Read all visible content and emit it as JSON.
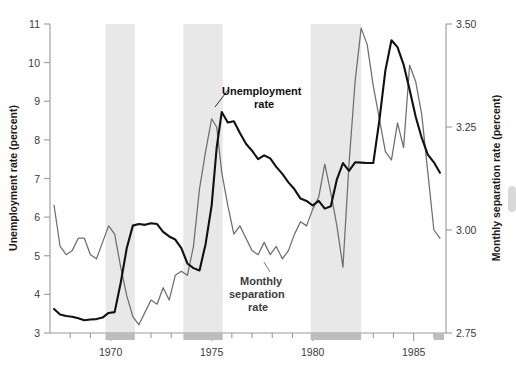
{
  "chart_data": {
    "type": "line",
    "title": "",
    "xlabel": "",
    "xlim": [
      1967.0,
      1986.6
    ],
    "x_tick_labels": [
      "1970",
      "1975",
      "1980",
      "1985"
    ],
    "x_tick_values": [
      1970,
      1975,
      1980,
      1985
    ],
    "x_minor_tick_step": 1,
    "grid": false,
    "legend": "in-plot annotations",
    "axes": [
      {
        "id": "left",
        "ylabel": "Unemployment rate (percent)",
        "ylim": [
          3,
          11
        ],
        "y_tick_labels": [
          "3",
          "4",
          "5",
          "6",
          "7",
          "8",
          "9",
          "10",
          "11"
        ],
        "y_tick_values": [
          3,
          4,
          5,
          6,
          7,
          8,
          9,
          10,
          11
        ]
      },
      {
        "id": "right",
        "ylabel": "Monthly separation rate (percent)",
        "ylim": [
          2.75,
          3.5
        ],
        "y_tick_labels": [
          "2.75",
          "3.00",
          "3.25",
          "3.50"
        ],
        "y_tick_values": [
          2.75,
          3.0,
          3.25,
          3.5
        ]
      }
    ],
    "shaded_bands": {
      "description": "recession bands",
      "color": "#e8e8e8",
      "ranges": [
        [
          1969.75,
          1971.2
        ],
        [
          1973.6,
          1975.55
        ],
        [
          1979.9,
          1982.4
        ]
      ]
    },
    "series": [
      {
        "name": "Unemployment rate",
        "axis": "left",
        "color": "#111111",
        "units": "percent",
        "x": [
          1967.2,
          1967.5,
          1967.8,
          1968.1,
          1968.4,
          1968.7,
          1969.0,
          1969.3,
          1969.6,
          1969.9,
          1970.2,
          1970.5,
          1970.8,
          1971.1,
          1971.4,
          1971.7,
          1972.0,
          1972.3,
          1972.6,
          1972.9,
          1973.2,
          1973.5,
          1973.8,
          1974.1,
          1974.4,
          1974.7,
          1975.0,
          1975.25,
          1975.5,
          1975.8,
          1976.1,
          1976.4,
          1976.7,
          1977.0,
          1977.3,
          1977.6,
          1977.9,
          1978.2,
          1978.5,
          1978.8,
          1979.1,
          1979.4,
          1979.7,
          1980.0,
          1980.3,
          1980.6,
          1980.9,
          1981.2,
          1981.5,
          1981.8,
          1982.1,
          1982.4,
          1982.7,
          1983.0,
          1983.3,
          1983.6,
          1983.9,
          1984.2,
          1984.5,
          1984.8,
          1985.1,
          1985.4,
          1985.7,
          1986.0,
          1986.3
        ],
        "y": [
          3.62,
          3.48,
          3.44,
          3.42,
          3.38,
          3.33,
          3.35,
          3.36,
          3.4,
          3.52,
          3.54,
          4.3,
          5.2,
          5.78,
          5.82,
          5.8,
          5.84,
          5.82,
          5.62,
          5.5,
          5.42,
          5.2,
          4.8,
          4.68,
          4.62,
          5.3,
          6.3,
          7.8,
          8.72,
          8.45,
          8.48,
          8.18,
          7.9,
          7.72,
          7.5,
          7.6,
          7.52,
          7.3,
          7.12,
          6.9,
          6.72,
          6.48,
          6.42,
          6.3,
          6.42,
          6.22,
          6.28,
          6.98,
          7.4,
          7.2,
          7.42,
          7.41,
          7.4,
          7.4,
          8.5,
          9.8,
          10.58,
          10.4,
          9.95,
          9.3,
          8.6,
          8.05,
          7.62,
          7.42,
          7.15
        ]
      },
      {
        "name": "Monthly separation rate",
        "axis": "right",
        "color": "#6e6e6e",
        "units": "percent",
        "x": [
          1967.2,
          1967.5,
          1967.8,
          1968.1,
          1968.4,
          1968.7,
          1969.0,
          1969.3,
          1969.6,
          1969.9,
          1970.2,
          1970.5,
          1970.8,
          1971.1,
          1971.4,
          1971.7,
          1972.0,
          1972.3,
          1972.6,
          1972.9,
          1973.2,
          1973.5,
          1973.8,
          1974.1,
          1974.4,
          1974.7,
          1975.0,
          1975.25,
          1975.5,
          1975.8,
          1976.1,
          1976.4,
          1976.7,
          1977.0,
          1977.3,
          1977.6,
          1977.9,
          1978.2,
          1978.5,
          1978.8,
          1979.1,
          1979.4,
          1979.7,
          1980.0,
          1980.3,
          1980.6,
          1980.9,
          1981.2,
          1981.5,
          1981.8,
          1982.1,
          1982.4,
          1982.7,
          1983.0,
          1983.3,
          1983.6,
          1983.9,
          1984.2,
          1984.5,
          1984.8,
          1985.1,
          1985.4,
          1985.7,
          1986.0,
          1986.3
        ],
        "y_left_equivalent": [
          6.1,
          5.2,
          5.05,
          5.08,
          5.42,
          5.38,
          5.05,
          4.96,
          5.32,
          5.8,
          5.52,
          4.7,
          4.0,
          3.45,
          3.22,
          3.5,
          3.78,
          3.72,
          4.12,
          3.85,
          4.48,
          4.55,
          4.45,
          5.2,
          6.6,
          7.6,
          8.45,
          8.2,
          7.1,
          6.3,
          5.55,
          5.72,
          5.42,
          5.1,
          5.05,
          5.3,
          4.98,
          5.28,
          4.88,
          5.12,
          5.55,
          5.82,
          5.7,
          6.12,
          6.35,
          7.2,
          6.6,
          5.8,
          4.72,
          7.2,
          9.3,
          10.7,
          10.25,
          9.2,
          8.3,
          7.5,
          7.3,
          8.1,
          7.55,
          9.6,
          9.2,
          8.4,
          7.2,
          6.0,
          5.85
        ],
        "y": [
          3.06,
          2.96,
          2.94,
          2.95,
          2.98,
          2.98,
          2.94,
          2.93,
          2.97,
          3.01,
          2.99,
          2.91,
          2.84,
          2.79,
          2.77,
          2.8,
          2.83,
          2.82,
          2.86,
          2.83,
          2.89,
          2.9,
          2.89,
          2.96,
          3.1,
          3.19,
          3.27,
          3.25,
          3.14,
          3.06,
          2.99,
          3.01,
          2.98,
          2.95,
          2.94,
          2.97,
          2.94,
          2.96,
          2.93,
          2.95,
          2.99,
          3.02,
          3.01,
          3.05,
          3.08,
          3.16,
          3.09,
          3.01,
          2.91,
          3.16,
          3.36,
          3.49,
          3.45,
          3.35,
          3.27,
          3.19,
          3.17,
          3.26,
          3.2,
          3.4,
          3.36,
          3.28,
          3.14,
          3.0,
          2.98
        ]
      }
    ],
    "annotations": [
      {
        "id": "unemployment-label",
        "text_lines": [
          "Unemployment",
          "rate"
        ],
        "text": "Unemployment rate",
        "color": "#111111"
      },
      {
        "id": "separation-label",
        "text_lines": [
          "Monthly",
          "separation",
          "rate"
        ],
        "text": "Monthly separation rate",
        "color": "#3d3d3d"
      }
    ]
  },
  "axis_left": {
    "title": "Unemployment rate (percent)",
    "ticks": [
      "11",
      "10",
      "9",
      "8",
      "7",
      "6",
      "5",
      "4",
      "3"
    ]
  },
  "axis_right": {
    "title": "Monthly separation rate (percent)",
    "ticks": [
      "3.50",
      "3.25",
      "3.00",
      "2.75"
    ]
  },
  "axis_bottom": {
    "ticks": [
      "1970",
      "1975",
      "1980",
      "1985"
    ]
  },
  "annotations": {
    "unemployment": {
      "line1": "Unemployment",
      "line2": "rate"
    },
    "separation": {
      "line1": "Monthly",
      "line2": "separation",
      "line3": "rate"
    }
  }
}
